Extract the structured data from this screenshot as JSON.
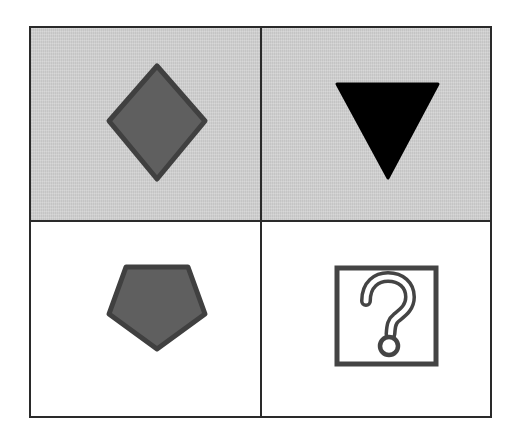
{
  "puzzle": {
    "layout": "2x2 grid",
    "colors": {
      "border": "#2a2a2a",
      "shaded_background": "#cfcfcf",
      "plain_background": "#ffffff",
      "shape_fill_gray": "#5f5f5f",
      "shape_stroke_gray": "#404040",
      "shape_fill_black": "#000000"
    },
    "cells": [
      {
        "position": "top-left",
        "background": "shaded",
        "shape": "diamond",
        "fill": "dark gray",
        "label": "Gray diamond on shaded background"
      },
      {
        "position": "top-right",
        "background": "shaded",
        "shape": "inverted triangle",
        "fill": "black",
        "label": "Black downward triangle on shaded background"
      },
      {
        "position": "bottom-left",
        "background": "white",
        "shape": "pentagon",
        "fill": "dark gray",
        "label": "Gray pentagon on white background"
      },
      {
        "position": "bottom-right",
        "background": "white",
        "shape": "question mark box",
        "fill": "none",
        "label": "Missing answer",
        "symbol": "?"
      }
    ]
  }
}
